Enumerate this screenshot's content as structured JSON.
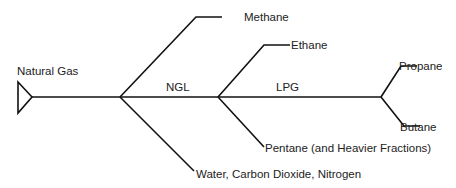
{
  "diagram": {
    "source": {
      "label": "Natural Gas"
    },
    "segments": {
      "ngl": "NGL",
      "lpg": "LPG"
    },
    "products": {
      "methane": "Methane",
      "water_co2_n2": "Water, Carbon Dioxide, Nitrogen",
      "ethane": "Ethane",
      "pentane": "Pentane (and Heavier Fractions)",
      "propane": "Propane",
      "butane": "Butane"
    },
    "colors": {
      "line": "#111111",
      "text": "#222222",
      "background": "#ffffff"
    }
  }
}
